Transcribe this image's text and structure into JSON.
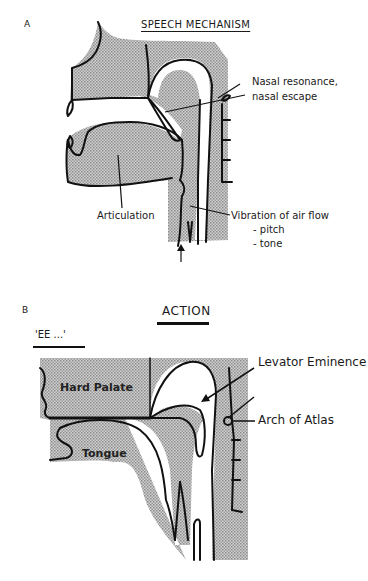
{
  "panel_a": {
    "letter": "A",
    "title": "SPEECH MECHANISM",
    "labels": {
      "nasal_line1": "Nasal resonance,",
      "nasal_line2": "nasal escape",
      "articulation": "Articulation",
      "vibration_line1": "Vibration of air flow",
      "vibration_line2": "- pitch",
      "vibration_line3": "- tone"
    }
  },
  "panel_b": {
    "letter": "B",
    "title": "ACTION",
    "sound": "'EE ...'",
    "labels": {
      "levator": "Levator Eminence",
      "atlas": "Arch of Atlas",
      "hard_palate": "Hard Palate",
      "tongue": "Tongue"
    }
  },
  "colors": {
    "stipple": "#b8b8b8",
    "line": "#111111"
  }
}
